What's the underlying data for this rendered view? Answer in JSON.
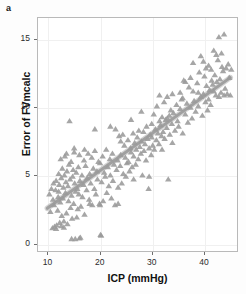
{
  "figure": {
    "panel_label": "a",
    "background_color": "#ffffff",
    "frame_color": "#b9b9b9"
  },
  "chart_data": {
    "type": "scatter",
    "title": "",
    "xlabel": "ICP (mmHg)",
    "ylabel": "Error of FVmcalc",
    "xlim": [
      8.0,
      46.5
    ],
    "ylim": [
      -0.6,
      16.6
    ],
    "xticks": [
      10,
      20,
      30,
      40
    ],
    "yticks": [
      0,
      5,
      10,
      15
    ],
    "grid": true,
    "legend": null,
    "marker": {
      "shape": "triangle-up",
      "color": "#9a9a9a",
      "size": 4.2,
      "count": 252
    },
    "trendline": {
      "type": "linear-fit-with-band",
      "color": "#a0a0a0",
      "band_color": "#b0b0b0",
      "x_start": 9.8,
      "y_start": 2.55,
      "x_end": 45.2,
      "y_end": 12.2,
      "slope": 0.2726,
      "intercept": -0.117
    },
    "points": [
      [
        10.2,
        3.6
      ],
      [
        10.4,
        2.3
      ],
      [
        10.6,
        4.0
      ],
      [
        10.8,
        1.1
      ],
      [
        10.9,
        3.2
      ],
      [
        11.1,
        2.8
      ],
      [
        11.2,
        1.2
      ],
      [
        11.4,
        3.9
      ],
      [
        11.5,
        4.6
      ],
      [
        11.6,
        1.3
      ],
      [
        11.8,
        2.4
      ],
      [
        11.9,
        3.4
      ],
      [
        12.0,
        5.1
      ],
      [
        12.1,
        4.3
      ],
      [
        12.2,
        1.5
      ],
      [
        12.3,
        3.0
      ],
      [
        12.4,
        6.2
      ],
      [
        12.5,
        4.8
      ],
      [
        12.6,
        2.0
      ],
      [
        12.7,
        5.5
      ],
      [
        12.8,
        3.3
      ],
      [
        12.9,
        4.1
      ],
      [
        13.0,
        1.6
      ],
      [
        13.1,
        5.0
      ],
      [
        13.2,
        6.4
      ],
      [
        13.3,
        3.7
      ],
      [
        13.4,
        4.5
      ],
      [
        13.5,
        2.2
      ],
      [
        13.6,
        5.3
      ],
      [
        13.7,
        1.4
      ],
      [
        13.8,
        4.2
      ],
      [
        13.9,
        3.1
      ],
      [
        14.0,
        5.8
      ],
      [
        14.1,
        9.0
      ],
      [
        14.2,
        4.7
      ],
      [
        14.3,
        2.6
      ],
      [
        14.4,
        6.0
      ],
      [
        14.5,
        3.5
      ],
      [
        14.6,
        1.8
      ],
      [
        14.7,
        4.9
      ],
      [
        14.8,
        5.4
      ],
      [
        14.9,
        2.9
      ],
      [
        15.0,
        6.7
      ],
      [
        15.1,
        4.4
      ],
      [
        15.2,
        0.3
      ],
      [
        15.3,
        3.8
      ],
      [
        15.4,
        5.2
      ],
      [
        15.5,
        1.9
      ],
      [
        15.6,
        4.0
      ],
      [
        15.7,
        2.5
      ],
      [
        15.8,
        5.6
      ],
      [
        15.9,
        3.6
      ],
      [
        16.0,
        6.5
      ],
      [
        16.1,
        4.6
      ],
      [
        16.2,
        0.4
      ],
      [
        16.3,
        2.7
      ],
      [
        16.5,
        5.0
      ],
      [
        16.6,
        3.4
      ],
      [
        16.8,
        4.3
      ],
      [
        16.9,
        6.1
      ],
      [
        17.0,
        2.1
      ],
      [
        17.2,
        5.7
      ],
      [
        17.4,
        3.9
      ],
      [
        17.5,
        4.8
      ],
      [
        17.7,
        6.6
      ],
      [
        17.9,
        3.2
      ],
      [
        18.0,
        5.1
      ],
      [
        18.2,
        4.4
      ],
      [
        18.4,
        6.3
      ],
      [
        18.5,
        2.8
      ],
      [
        18.7,
        5.5
      ],
      [
        18.9,
        4.0
      ],
      [
        19.0,
        6.8
      ],
      [
        19.2,
        3.6
      ],
      [
        19.4,
        5.3
      ],
      [
        19.5,
        4.7
      ],
      [
        19.7,
        6.0
      ],
      [
        19.9,
        2.9
      ],
      [
        20.0,
        5.9
      ],
      [
        20.1,
        0.6
      ],
      [
        20.3,
        4.5
      ],
      [
        20.5,
        6.4
      ],
      [
        20.6,
        3.1
      ],
      [
        20.8,
        5.2
      ],
      [
        21.0,
        4.9
      ],
      [
        21.2,
        6.9
      ],
      [
        21.3,
        3.7
      ],
      [
        21.5,
        5.6
      ],
      [
        21.7,
        4.2
      ],
      [
        21.9,
        6.2
      ],
      [
        22.0,
        5.0
      ],
      [
        22.2,
        3.3
      ],
      [
        22.4,
        6.6
      ],
      [
        22.5,
        4.6
      ],
      [
        22.7,
        5.8
      ],
      [
        22.9,
        2.8
      ],
      [
        23.0,
        8.4
      ],
      [
        23.2,
        5.4
      ],
      [
        23.4,
        6.1
      ],
      [
        23.5,
        4.1
      ],
      [
        23.7,
        7.9
      ],
      [
        23.9,
        5.7
      ],
      [
        24.0,
        6.5
      ],
      [
        24.2,
        4.4
      ],
      [
        24.4,
        8.0
      ],
      [
        24.5,
        5.1
      ],
      [
        24.7,
        7.2
      ],
      [
        24.9,
        6.3
      ],
      [
        25.0,
        4.9
      ],
      [
        25.2,
        5.9
      ],
      [
        25.4,
        7.6
      ],
      [
        25.5,
        6.0
      ],
      [
        25.7,
        5.3
      ],
      [
        25.9,
        7.0
      ],
      [
        26.0,
        6.7
      ],
      [
        26.2,
        5.6
      ],
      [
        26.4,
        8.1
      ],
      [
        26.5,
        6.4
      ],
      [
        26.7,
        7.4
      ],
      [
        26.9,
        5.8
      ],
      [
        27.0,
        6.9
      ],
      [
        27.2,
        7.8
      ],
      [
        27.4,
        6.2
      ],
      [
        27.5,
        8.3
      ],
      [
        27.7,
        7.1
      ],
      [
        27.9,
        6.6
      ],
      [
        28.0,
        7.5
      ],
      [
        28.2,
        5.0
      ],
      [
        28.4,
        8.2
      ],
      [
        28.5,
        6.8
      ],
      [
        28.7,
        7.3
      ],
      [
        28.9,
        6.1
      ],
      [
        29.0,
        8.6
      ],
      [
        29.2,
        7.7
      ],
      [
        29.4,
        4.0
      ],
      [
        29.5,
        7.0
      ],
      [
        29.7,
        8.0
      ],
      [
        29.9,
        6.5
      ],
      [
        30.0,
        8.8
      ],
      [
        30.2,
        7.2
      ],
      [
        30.4,
        9.5
      ],
      [
        30.5,
        6.9
      ],
      [
        30.7,
        8.4
      ],
      [
        30.9,
        7.6
      ],
      [
        31.0,
        10.1
      ],
      [
        31.2,
        8.1
      ],
      [
        31.4,
        7.3
      ],
      [
        31.5,
        9.0
      ],
      [
        31.7,
        8.7
      ],
      [
        31.9,
        7.9
      ],
      [
        32.0,
        9.3
      ],
      [
        32.2,
        8.2
      ],
      [
        32.4,
        10.4
      ],
      [
        32.5,
        7.7
      ],
      [
        32.7,
        9.1
      ],
      [
        32.9,
        8.5
      ],
      [
        33.0,
        10.8
      ],
      [
        33.2,
        4.7
      ],
      [
        33.4,
        9.4
      ],
      [
        33.5,
        8.0
      ],
      [
        33.7,
        9.8
      ],
      [
        33.9,
        8.8
      ],
      [
        34.0,
        7.4
      ],
      [
        34.2,
        9.6
      ],
      [
        34.5,
        8.3
      ],
      [
        34.8,
        10.2
      ],
      [
        35.0,
        9.0
      ],
      [
        35.2,
        8.6
      ],
      [
        35.5,
        9.9
      ],
      [
        35.8,
        10.6
      ],
      [
        36.0,
        8.1
      ],
      [
        36.2,
        12.0
      ],
      [
        36.5,
        9.5
      ],
      [
        36.8,
        10.3
      ],
      [
        37.0,
        8.9
      ],
      [
        37.2,
        11.5
      ],
      [
        37.5,
        10.0
      ],
      [
        37.8,
        9.2
      ],
      [
        38.0,
        11.2
      ],
      [
        38.2,
        10.5
      ],
      [
        38.5,
        9.7
      ],
      [
        38.8,
        11.8
      ],
      [
        39.0,
        10.1
      ],
      [
        39.2,
        12.6
      ],
      [
        39.5,
        10.8
      ],
      [
        39.8,
        9.4
      ],
      [
        40.0,
        11.0
      ],
      [
        40.2,
        12.3
      ],
      [
        40.4,
        10.4
      ],
      [
        40.6,
        11.6
      ],
      [
        40.8,
        9.8
      ],
      [
        41.0,
        13.1
      ],
      [
        41.2,
        11.3
      ],
      [
        41.4,
        10.2
      ],
      [
        41.6,
        12.0
      ],
      [
        41.8,
        11.7
      ],
      [
        42.0,
        14.2
      ],
      [
        42.2,
        12.4
      ],
      [
        42.4,
        10.9
      ],
      [
        42.6,
        11.9
      ],
      [
        42.8,
        13.5
      ],
      [
        43.0,
        15.2
      ],
      [
        43.2,
        12.1
      ],
      [
        43.4,
        11.1
      ],
      [
        43.6,
        13.0
      ],
      [
        43.8,
        12.7
      ],
      [
        44.0,
        15.4
      ],
      [
        44.2,
        11.4
      ],
      [
        44.4,
        12.9
      ],
      [
        44.6,
        11.0
      ],
      [
        44.8,
        13.2
      ],
      [
        45.0,
        12.2
      ],
      [
        45.2,
        10.9
      ],
      [
        45.4,
        12.8
      ],
      [
        34.0,
        11.0
      ],
      [
        35.5,
        11.1
      ],
      [
        36.5,
        11.9
      ],
      [
        38.0,
        13.3
      ],
      [
        39.0,
        11.1
      ],
      [
        40.0,
        13.4
      ],
      [
        41.0,
        10.6
      ],
      [
        42.0,
        11.2
      ],
      [
        43.0,
        10.8
      ],
      [
        44.0,
        10.9
      ],
      [
        42.5,
        13.9
      ],
      [
        43.5,
        14.0
      ],
      [
        41.5,
        12.8
      ],
      [
        40.5,
        12.9
      ],
      [
        39.5,
        13.8
      ],
      [
        37.5,
        12.2
      ],
      [
        36.0,
        10.7
      ],
      [
        33.0,
        9.2
      ],
      [
        31.5,
        10.9
      ],
      [
        30.0,
        7.8
      ],
      [
        28.0,
        9.7
      ],
      [
        26.0,
        9.1
      ],
      [
        24.0,
        7.5
      ],
      [
        22.0,
        8.6
      ],
      [
        19.0,
        8.4
      ],
      [
        17.0,
        6.9
      ],
      [
        15.0,
        7.0
      ],
      [
        13.5,
        6.6
      ],
      [
        12.0,
        3.8
      ],
      [
        11.0,
        4.4
      ],
      [
        18.0,
        2.9
      ],
      [
        20.0,
        2.8
      ],
      [
        23.5,
        2.9
      ],
      [
        26.5,
        4.7
      ],
      [
        29.5,
        4.9
      ],
      [
        32.0,
        6.9
      ],
      [
        14.5,
        0.3
      ],
      [
        16.0,
        0.35
      ],
      [
        20.2,
        0.55
      ],
      [
        12.5,
        1.25
      ],
      [
        13.0,
        1.15
      ],
      [
        11.5,
        1.05
      ]
    ]
  }
}
